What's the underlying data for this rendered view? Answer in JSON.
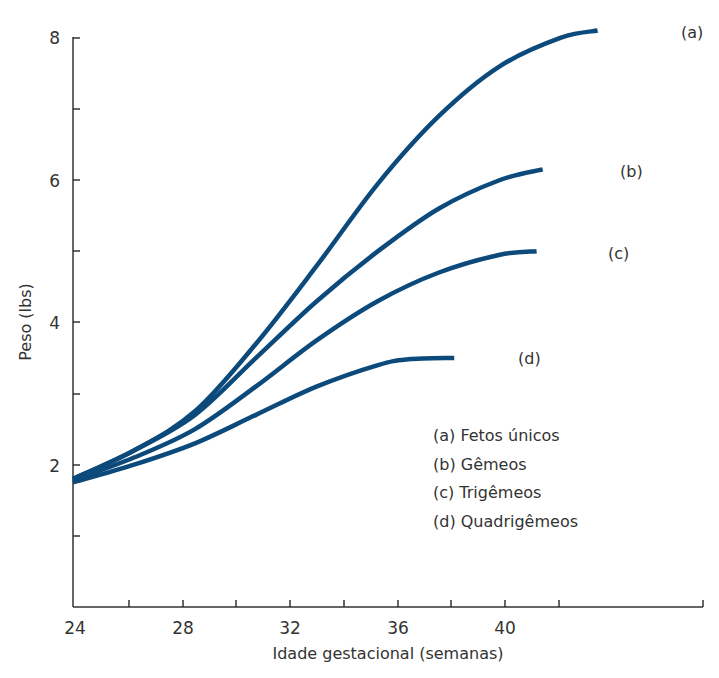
{
  "chart_data": {
    "type": "line",
    "title": "",
    "xlabel": "Idade gestacional (semanas)",
    "ylabel": "Peso (lbs)",
    "xlim": [
      24,
      42
    ],
    "ylim": [
      0,
      8.2
    ],
    "x_ticks_major": [
      24,
      28,
      32,
      36,
      40
    ],
    "x_ticks_minor": [
      26,
      30,
      34,
      38,
      42
    ],
    "y_ticks_major": [
      2,
      4,
      6,
      8
    ],
    "y_ticks_minor": [
      1,
      3,
      5,
      7
    ],
    "grid": false,
    "line_color": "#0d4a7c",
    "series": [
      {
        "name": "(a) Fetos únicos",
        "label": "(a)",
        "x": [
          24,
          26,
          28,
          30,
          32,
          34,
          36,
          38,
          40,
          41.2
        ],
        "values": [
          1.8,
          2.2,
          2.75,
          3.7,
          4.8,
          5.95,
          6.9,
          7.6,
          8.0,
          8.1
        ]
      },
      {
        "name": "(b) Gêmeos",
        "label": "(b)",
        "x": [
          24,
          26,
          28,
          30,
          32,
          34,
          36,
          38,
          39.4
        ],
        "values": [
          1.8,
          2.2,
          2.7,
          3.5,
          4.3,
          5.0,
          5.6,
          6.0,
          6.15
        ]
      },
      {
        "name": "(c) Trigêmeos",
        "label": "(c)",
        "x": [
          24,
          26,
          28,
          30,
          32,
          34,
          36,
          38,
          39.2
        ],
        "values": [
          1.78,
          2.1,
          2.5,
          3.1,
          3.75,
          4.3,
          4.7,
          4.95,
          5.0
        ]
      },
      {
        "name": "(d) Quadrigêmeos",
        "label": "(d)",
        "x": [
          24,
          26,
          28,
          30,
          32,
          34,
          35,
          36.5
        ],
        "values": [
          1.75,
          2.0,
          2.3,
          2.7,
          3.1,
          3.4,
          3.48,
          3.5
        ]
      }
    ],
    "legend": {
      "position": "inside-lower-right",
      "entries": [
        "(a) Fetos únicos",
        "(b) Gêmeos",
        "(c) Trigêmeos",
        "(d) Quadrigêmeos"
      ]
    }
  },
  "axes": {
    "x_tick_labels": [
      "24",
      "28",
      "32",
      "36",
      "40"
    ],
    "y_tick_labels": [
      "2",
      "4",
      "6",
      "8"
    ],
    "x_title": "Idade gestacional (semanas)",
    "y_title": "Peso (lbs)"
  },
  "labels": {
    "a": "(a)",
    "b": "(b)",
    "c": "(c)",
    "d": "(d)"
  },
  "legend": [
    "(a) Fetos únicos",
    "(b) Gêmeos",
    "(c) Trigêmeos",
    "(d) Quadrigêmeos"
  ]
}
